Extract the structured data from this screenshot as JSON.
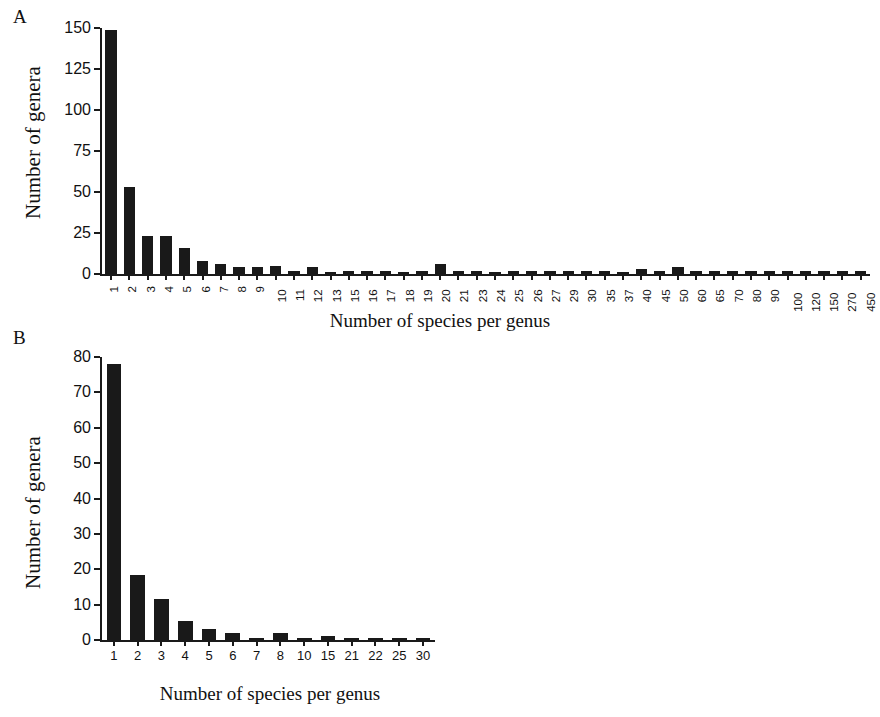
{
  "figure": {
    "background_color": "#ffffff",
    "bar_color": "#191919",
    "axis_color": "#1a1a1a"
  },
  "panels": {
    "a": {
      "letter": "A",
      "ylabel": "Number of genera",
      "xlabel": "Number of species per genus"
    },
    "b": {
      "letter": "B",
      "ylabel": "Number of genera",
      "xlabel": "Number of species per genus"
    }
  },
  "chart_data": [
    {
      "type": "bar",
      "panel": "A",
      "title": "",
      "xlabel": "Number of species per genus",
      "ylabel": "Number of genera",
      "ylim": [
        0,
        150
      ],
      "yticks": [
        0,
        25,
        50,
        75,
        100,
        125,
        150
      ],
      "grid": false,
      "legend": "none",
      "categories": [
        "1",
        "2",
        "3",
        "4",
        "5",
        "6",
        "7",
        "8",
        "9",
        "10",
        "11",
        "12",
        "13",
        "15",
        "16",
        "17",
        "18",
        "19",
        "20",
        "21",
        "23",
        "24",
        "25",
        "26",
        "27",
        "29",
        "30",
        "35",
        "37",
        "40",
        "45",
        "50",
        "60",
        "65",
        "70",
        "80",
        "90",
        "100",
        "120",
        "150",
        "270",
        "450"
      ],
      "values": [
        149,
        53,
        23,
        23,
        16,
        8,
        6,
        4,
        4,
        5,
        2,
        4,
        1,
        2,
        2,
        2,
        1,
        2,
        6,
        2,
        2,
        1,
        2,
        2,
        2,
        2,
        2,
        2,
        1,
        3,
        2,
        4,
        2,
        2,
        2,
        2,
        2,
        2,
        2,
        2,
        2,
        2
      ]
    },
    {
      "type": "bar",
      "panel": "B",
      "title": "",
      "xlabel": "Number of species per genus",
      "ylabel": "Number of genera",
      "ylim": [
        0,
        80
      ],
      "yticks": [
        0,
        10,
        20,
        30,
        40,
        50,
        60,
        70,
        80
      ],
      "grid": false,
      "legend": "none",
      "categories": [
        "1",
        "2",
        "3",
        "4",
        "5",
        "6",
        "7",
        "8",
        "10",
        "15",
        "21",
        "22",
        "25",
        "30"
      ],
      "values": [
        78,
        18.5,
        11.5,
        5.5,
        3,
        2,
        0.6,
        2,
        0.6,
        1.1,
        0.5,
        0.5,
        0.6,
        0.6
      ]
    }
  ]
}
